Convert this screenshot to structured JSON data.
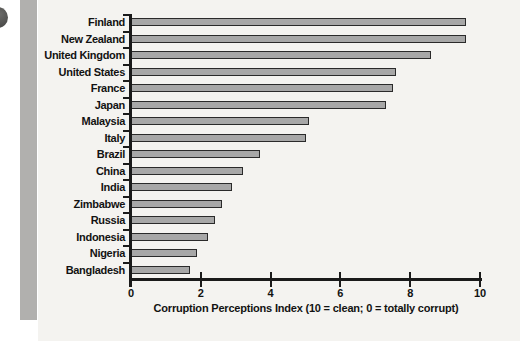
{
  "chart_data": {
    "type": "bar",
    "orientation": "horizontal",
    "categories": [
      "Finland",
      "New Zealand",
      "United Kingdom",
      "United States",
      "France",
      "Japan",
      "Malaysia",
      "Italy",
      "Brazil",
      "China",
      "India",
      "Zimbabwe",
      "Russia",
      "Indonesia",
      "Nigeria",
      "Bangladesh"
    ],
    "values": [
      9.6,
      9.6,
      8.6,
      7.6,
      7.5,
      7.3,
      5.1,
      5.0,
      3.7,
      3.2,
      2.9,
      2.6,
      2.4,
      2.2,
      1.9,
      1.7
    ],
    "xlabel": "Corruption Perceptions Index (10 = clean; 0 = totally corrupt)",
    "xticks": [
      0,
      2,
      4,
      6,
      8,
      10
    ],
    "xlim": [
      0,
      10
    ],
    "grid": false,
    "legend": null,
    "bar_color": "#a7a7a7",
    "bar_border_color": "#2a2a2a"
  },
  "page": {
    "background_color": "#ffffff",
    "panel_color": "#f4f3f0",
    "strip_color": "#b1b0ae",
    "bullet_color": "#4a4a48",
    "axis_color": "#1a1a1a",
    "text_color": "#121212"
  }
}
